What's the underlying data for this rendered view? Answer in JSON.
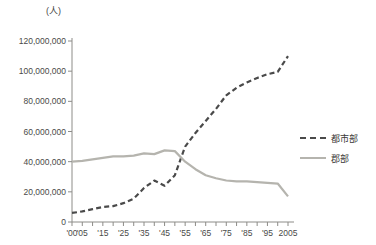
{
  "chart_data": {
    "type": "line",
    "title": "",
    "subtitle": "",
    "unit_label": "(人)",
    "xlabel": "",
    "ylabel": "",
    "ylim": [
      0,
      120000000
    ],
    "xlim": [
      1900,
      2005
    ],
    "grid": false,
    "legend_position": "right",
    "y_ticks": [
      0,
      20000000,
      40000000,
      60000000,
      80000000,
      100000000,
      120000000
    ],
    "y_tick_labels": [
      "0",
      "20,000,000",
      "40,000,000",
      "60,000,000",
      "80,000,000",
      "100,000,000",
      "120,000,000"
    ],
    "x_ticks": [
      1900,
      1905,
      1910,
      1915,
      1920,
      1925,
      1930,
      1935,
      1940,
      1945,
      1950,
      1955,
      1960,
      1965,
      1970,
      1975,
      1980,
      1985,
      1990,
      1995,
      2000,
      2005
    ],
    "x_tick_labels": [
      {
        "x": 1900,
        "label": "'00"
      },
      {
        "x": 1905,
        "label": "'05"
      },
      {
        "x": 1915,
        "label": "'15"
      },
      {
        "x": 1925,
        "label": "'25"
      },
      {
        "x": 1935,
        "label": "'35"
      },
      {
        "x": 1945,
        "label": "'45"
      },
      {
        "x": 1955,
        "label": "'55"
      },
      {
        "x": 1965,
        "label": "'65"
      },
      {
        "x": 1975,
        "label": "'75"
      },
      {
        "x": 1985,
        "label": "'85"
      },
      {
        "x": 1995,
        "label": "'95"
      },
      {
        "x": 2005,
        "label": "2005"
      }
    ],
    "series": [
      {
        "name": "都市部",
        "style": "dashed",
        "color": "#4a4a4a",
        "x": [
          1900,
          1905,
          1910,
          1915,
          1920,
          1925,
          1930,
          1935,
          1940,
          1945,
          1950,
          1955,
          1960,
          1965,
          1970,
          1975,
          1980,
          1985,
          1990,
          1995,
          2000,
          2005
        ],
        "values": [
          6000000,
          7000000,
          8500000,
          10000000,
          10500000,
          12500000,
          15500000,
          22500000,
          27500000,
          24000000,
          31000000,
          50000000,
          59000000,
          67000000,
          75000000,
          84000000,
          89000000,
          92500000,
          95500000,
          98000000,
          99500000,
          110000000
        ]
      },
      {
        "name": "郡部",
        "style": "solid",
        "color": "#b5b4ae",
        "x": [
          1900,
          1905,
          1910,
          1915,
          1920,
          1925,
          1930,
          1935,
          1940,
          1945,
          1950,
          1955,
          1960,
          1965,
          1970,
          1975,
          1980,
          1985,
          1990,
          1995,
          2000,
          2005
        ],
        "values": [
          40000000,
          40500000,
          41500000,
          42500000,
          43500000,
          43500000,
          44000000,
          45500000,
          45000000,
          47500000,
          47000000,
          40000000,
          35000000,
          31000000,
          29000000,
          27500000,
          27000000,
          27000000,
          26500000,
          26000000,
          25500000,
          17000000
        ]
      }
    ],
    "legend": [
      {
        "label": "都市部",
        "style": "dashed"
      },
      {
        "label": "郡部",
        "style": "solid"
      }
    ]
  }
}
